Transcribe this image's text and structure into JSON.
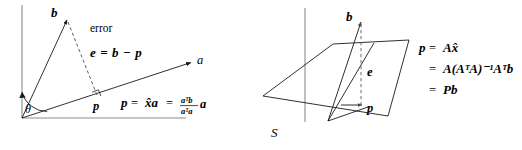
{
  "figure": {
    "stroke_color": "#1a1a1a",
    "axis_color": "#8c8c8c",
    "dashed_color": "#5a5a5a",
    "background": "#ffffff"
  },
  "left_panel": {
    "name": "projection-onto-line",
    "labels": {
      "vector_b": "b",
      "vector_a": "a",
      "point_p": "p",
      "angle_theta": "θ",
      "error_word": "error",
      "error_equation": "e = b − p",
      "projection_equation_lhs": "p",
      "eq1": "=",
      "projection_xa": "x̂a",
      "eq2": "=",
      "fraction_numerator": "aᵀb",
      "fraction_denominator": "aᵀa",
      "fraction_trailing": "a"
    },
    "geometry": {
      "origin": [
        22,
        118
      ],
      "b_tip": [
        68,
        18
      ],
      "a_tip": [
        196,
        62
      ],
      "p_point": [
        97,
        97
      ],
      "vertical_axis_top": [
        22,
        5
      ],
      "horizontal_axis_right": [
        186,
        118
      ],
      "right_angle_marker_at": [
        97,
        97
      ]
    }
  },
  "right_panel": {
    "name": "projection-onto-subspace",
    "labels": {
      "vector_b": "b",
      "point_p": "p",
      "error_e": "e",
      "subspace_S": "S",
      "eq_line1_lhs": "p",
      "eq_line1_eq": "=",
      "eq_line1_rhs": "Ax̂",
      "eq_line2_eq": "=",
      "eq_line2_rhs": "A(AᵀA)⁻¹Aᵀb",
      "eq_line3_eq": "=",
      "eq_line3_rhs": "Pb"
    },
    "geometry": {
      "origin": [
        67,
        120
      ],
      "b_tip": [
        100,
        20
      ],
      "p_point": [
        101,
        106
      ],
      "vertical_axis_top": [
        45,
        8
      ],
      "plane_corners": [
        [
          2,
          92
        ],
        [
          70,
          44
        ],
        [
          146,
          38
        ],
        [
          128,
          112
        ]
      ]
    }
  }
}
